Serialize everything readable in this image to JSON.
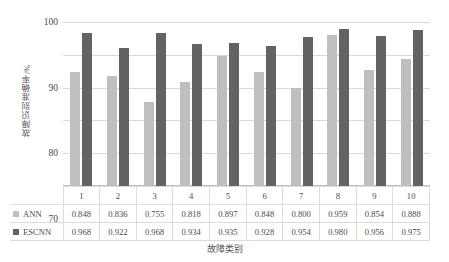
{
  "chart_data": {
    "type": "bar",
    "title": "",
    "xlabel": "故障类别",
    "ylabel": "故障识别准确率/%",
    "categories": [
      "1",
      "2",
      "3",
      "4",
      "5",
      "6",
      "7",
      "8",
      "9",
      "10"
    ],
    "ylim": [
      50,
      100
    ],
    "yticks": [
      50,
      60,
      70,
      80,
      90,
      100
    ],
    "grid": true,
    "legend_position": "table-row-headers",
    "series": [
      {
        "name": "ANN",
        "color": "#bfbfbf",
        "values": [
          0.848,
          0.836,
          0.755,
          0.818,
          0.897,
          0.848,
          0.8,
          0.959,
          0.854,
          0.888
        ],
        "labels": [
          "0.848",
          "0.836",
          "0.755",
          "0.818",
          "0.897",
          "0.848",
          "0.800",
          "0.959",
          "0.854",
          "0.888"
        ],
        "plotted_percent": [
          84.8,
          83.6,
          75.5,
          81.8,
          89.7,
          84.8,
          80.0,
          95.9,
          85.4,
          88.8
        ]
      },
      {
        "name": "ESCNN",
        "color": "#636363",
        "values": [
          0.968,
          0.922,
          0.968,
          0.934,
          0.935,
          0.928,
          0.954,
          0.98,
          0.956,
          0.975
        ],
        "labels": [
          "0.968",
          "0.922",
          "0.968",
          "0.934",
          "0.935",
          "0.928",
          "0.954",
          "0.980",
          "0.956",
          "0.975"
        ],
        "plotted_percent": [
          96.8,
          92.2,
          96.8,
          93.4,
          93.5,
          92.8,
          95.4,
          98.0,
          95.6,
          97.5
        ]
      }
    ]
  },
  "axis": {
    "y_title": "故障识别准确率/%",
    "x_title": "故障类别",
    "y_ticks": [
      "100",
      "90",
      "80",
      "70",
      "60",
      "50"
    ]
  },
  "table": {
    "header_row": [
      "",
      "1",
      "2",
      "3",
      "4",
      "5",
      "6",
      "7",
      "8",
      "9",
      "10"
    ],
    "rows": [
      {
        "label": "ANN",
        "cells": [
          "0.848",
          "0.836",
          "0.755",
          "0.818",
          "0.897",
          "0.848",
          "0.800",
          "0.959",
          "0.854",
          "0.888"
        ]
      },
      {
        "label": "ESCNN",
        "cells": [
          "0.968",
          "0.922",
          "0.968",
          "0.934",
          "0.935",
          "0.928",
          "0.954",
          "0.980",
          "0.956",
          "0.975"
        ]
      }
    ]
  },
  "colors": {
    "ann": "#bfbfbf",
    "escnn": "#636363",
    "gridline": "#d9d9d9",
    "table_border": "#dcdcdc",
    "background": "#ffffff"
  }
}
